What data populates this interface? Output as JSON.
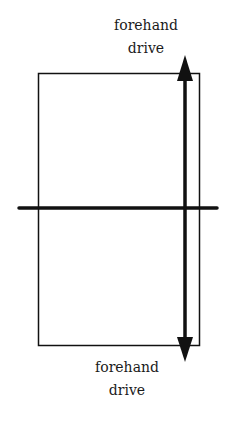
{
  "diagram": {
    "labels": {
      "top": {
        "line1": "forehand",
        "line2": "drive"
      },
      "bottom": {
        "line1": "forehand",
        "line2": "drive"
      }
    },
    "elements": {
      "table": "rectangle outline",
      "net": "horizontal center line",
      "arrow": "double-headed vertical arrow near right edge"
    },
    "colors": {
      "ink": "#111111",
      "background": "#ffffff"
    }
  }
}
